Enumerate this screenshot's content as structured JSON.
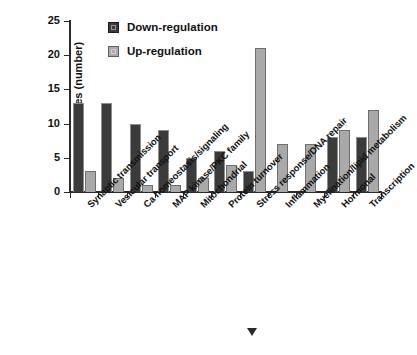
{
  "chart_data": {
    "type": "bar",
    "title": "",
    "subtitle": "",
    "xlabel": "",
    "ylabel": "Genes (number)",
    "ylim": [
      0,
      25
    ],
    "yticks": [
      0,
      5,
      10,
      15,
      20,
      25
    ],
    "grid": false,
    "legend_position": "top-left-inside",
    "categories": [
      "Synaptic transmission",
      "Vesicular transport",
      "Ca homeostasis/signaling",
      "MAP kinase/PKC family",
      "Mitochondrial",
      "Protein turnover",
      "Stress response/DNA repair",
      "Inflammation",
      "Myelination/lipid metabolism",
      "Hormonal",
      "Transcription"
    ],
    "series": [
      {
        "name": "Down-regulation",
        "color": "#3b3b3b",
        "values": [
          13,
          13,
          10,
          9,
          5,
          6,
          3,
          0,
          0,
          8,
          8
        ]
      },
      {
        "name": "Up-regulation",
        "color": "#a9a9a9",
        "values": [
          3,
          2,
          1,
          1,
          2,
          4,
          21,
          7,
          7,
          9,
          12
        ]
      }
    ]
  },
  "legend": {
    "items": [
      {
        "label": "Down-regulation",
        "swatch": "legend-swatch-down"
      },
      {
        "label": "Up-regulation",
        "swatch": "legend-swatch-up"
      }
    ]
  },
  "axes": {
    "y_title": "Genes (number)",
    "y_tick_labels": [
      "25",
      "20",
      "15",
      "10",
      "5",
      "0"
    ]
  },
  "caption": {
    "partial_text": "",
    "marker": ""
  }
}
